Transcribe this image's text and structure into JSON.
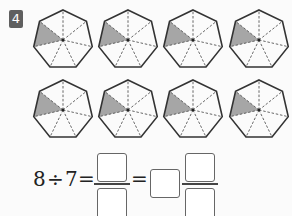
{
  "problem": {
    "number": "4",
    "badge_color": "#5f5f5f",
    "shape": "heptagon",
    "parts_per_shape": 7,
    "shaded_parts_per_shape": 1,
    "shape_count": 8,
    "rows": 2,
    "per_row": 4,
    "shade_color": "#a6a6a6",
    "equation": {
      "dividend": "8",
      "operator": "÷",
      "divisor": "7",
      "equals": "=",
      "blanks": [
        "improper-numerator",
        "improper-denominator",
        "whole-number",
        "mixed-numerator",
        "mixed-denominator"
      ]
    }
  }
}
